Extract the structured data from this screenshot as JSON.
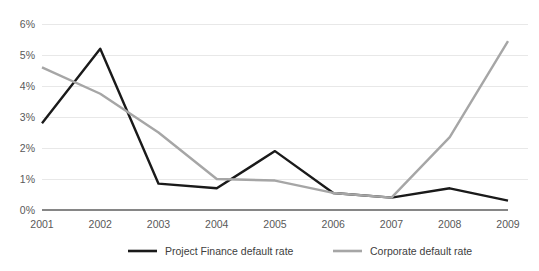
{
  "chart_data": {
    "type": "line",
    "title": "",
    "xlabel": "",
    "ylabel": "",
    "categories": [
      "2001",
      "2002",
      "2003",
      "2004",
      "2005",
      "2006",
      "2007",
      "2008",
      "2009"
    ],
    "x": [
      2001,
      2002,
      2003,
      2004,
      2005,
      2006,
      2007,
      2008,
      2009
    ],
    "ylim": [
      0,
      6
    ],
    "ytick_labels": [
      "0%",
      "1%",
      "2%",
      "3%",
      "4%",
      "5%",
      "6%"
    ],
    "ytick_values": [
      0,
      1,
      2,
      3,
      4,
      5,
      6
    ],
    "grid": true,
    "grid_axis": "y",
    "legend_position": "bottom",
    "series": [
      {
        "name": "Project Finance default rate",
        "color": "#1a1a1a",
        "width": 2.4,
        "values": [
          2.8,
          5.2,
          0.85,
          0.7,
          1.9,
          0.55,
          0.4,
          0.7,
          0.3
        ]
      },
      {
        "name": "Corporate default rate",
        "color": "#a6a6a6",
        "width": 2.4,
        "values": [
          4.6,
          3.75,
          2.5,
          1.0,
          0.95,
          0.55,
          0.4,
          2.35,
          5.45
        ]
      }
    ]
  },
  "colors": {
    "gridline": "#e8e8e8",
    "axis": "#868686",
    "tick_text": "#595959",
    "legend_text": "#404040",
    "background": "#ffffff"
  },
  "legend": {
    "items": [
      {
        "label": "Project Finance default rate",
        "color": "#1a1a1a"
      },
      {
        "label": "Corporate default rate",
        "color": "#a6a6a6"
      }
    ]
  }
}
